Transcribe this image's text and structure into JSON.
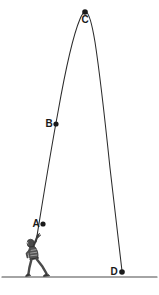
{
  "diagram": {
    "background_color": "#ffffff",
    "stroke_color": "#231f20",
    "ground": {
      "label": "ground-line",
      "y": 277,
      "x_start": 2,
      "x_end": 157,
      "color": "#4a4a4a"
    },
    "trajectory": {
      "name": "ball-path",
      "color": "#2b2b2b",
      "style": "solid",
      "apex_x": 85,
      "apex_y": 12,
      "launch_x": 38,
      "landing_x": 122
    },
    "points": [
      {
        "id": "A",
        "label": "A",
        "x": 43,
        "y": 224,
        "label_x": 36,
        "label_y": 224,
        "dot_r": 2.6
      },
      {
        "id": "B",
        "label": "B",
        "x": 56,
        "y": 124,
        "label_x": 49,
        "label_y": 124,
        "dot_r": 2.6
      },
      {
        "id": "C",
        "label": "C",
        "x": 85,
        "y": 12,
        "label_x": 85,
        "label_y": 20,
        "dot_r": 2.8
      },
      {
        "id": "D",
        "label": "D",
        "x": 122,
        "y": 272,
        "label_x": 114,
        "label_y": 272,
        "dot_r": 2.8
      }
    ],
    "thrower": {
      "name": "person-throwing",
      "pose": "lunging forward with right arm raised overhead after release",
      "color": "#3a3a3a",
      "origin_x": 22,
      "origin_y": 232,
      "height": 46
    }
  }
}
